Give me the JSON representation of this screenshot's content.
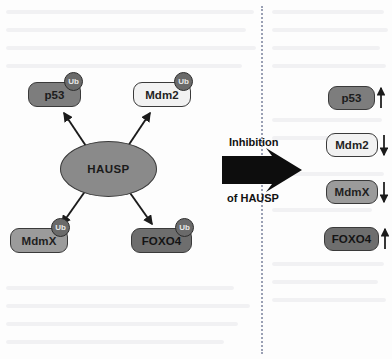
{
  "figure": {
    "divider_style": "dotted",
    "background": "#fdfdfd"
  },
  "left_panel": {
    "hub": {
      "label": "HAUSP",
      "shape": "ellipse",
      "fill": "#8a8a8a"
    },
    "ubiquitin_badge_label": "Ub",
    "substrates": [
      {
        "label": "p53",
        "fill": "#7d7d7d",
        "ubiquitinated": true
      },
      {
        "label": "Mdm2",
        "fill": "#f2f2f2",
        "ubiquitinated": true
      },
      {
        "label": "MdmX",
        "fill": "#9b9b9b",
        "ubiquitinated": true
      },
      {
        "label": "FOXO4",
        "fill": "#6e6e6e",
        "ubiquitinated": true
      }
    ]
  },
  "transition": {
    "caption_top": "Inhibition",
    "caption_bottom": "of HAUSP",
    "arrow": "block-arrow-right",
    "arrow_color": "#000000"
  },
  "right_panel": {
    "outcomes": [
      {
        "label": "p53",
        "fill": "#7d7d7d",
        "trend": "up",
        "trend_symbol": "↑"
      },
      {
        "label": "Mdm2",
        "fill": "#f2f2f2",
        "trend": "down",
        "trend_symbol": "↓"
      },
      {
        "label": "MdmX",
        "fill": "#9b9b9b",
        "trend": "down",
        "trend_symbol": "↓"
      },
      {
        "label": "FOXO4",
        "fill": "#6e6e6e",
        "trend": "up",
        "trend_symbol": "↑"
      }
    ]
  }
}
